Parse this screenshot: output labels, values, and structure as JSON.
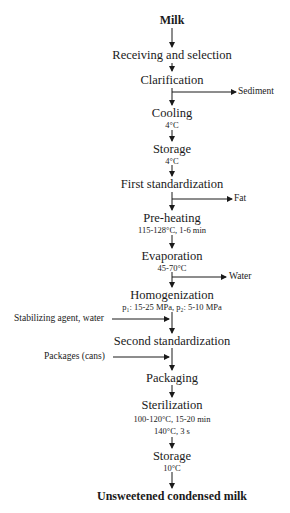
{
  "diagram": {
    "type": "process-flowchart",
    "start": "Milk",
    "end": "Unsweetened condensed milk",
    "steps": [
      {
        "label": "Receiving and selection",
        "detail": ""
      },
      {
        "label": "Clarification",
        "detail": ""
      },
      {
        "label": "Cooling",
        "detail": "4°C"
      },
      {
        "label": "Storage",
        "detail": "4°C"
      },
      {
        "label": "First standardization",
        "detail": ""
      },
      {
        "label": "Pre-heating",
        "detail": "115-128°C, 1-6 min"
      },
      {
        "label": "Evaporation",
        "detail": "45-70°C"
      },
      {
        "label": "Homogenization",
        "detail": "p₁: 15-25 MPa, p₂: 5-10 MPa"
      },
      {
        "label": "Second standardization",
        "detail": ""
      },
      {
        "label": "Packaging",
        "detail": ""
      },
      {
        "label": "Sterilization",
        "detail": "100-120°C, 15-20 min",
        "detail2": "140°C, 3 s"
      },
      {
        "label": "Storage",
        "detail": "10°C"
      }
    ],
    "outputs": [
      {
        "after": "Clarification",
        "label": "Sediment"
      },
      {
        "after": "First standardization",
        "label": "Fat"
      },
      {
        "after": "Evaporation",
        "label": "Water"
      }
    ],
    "inputs": [
      {
        "before": "Second standardization",
        "label": "Stabilizing agent, water"
      },
      {
        "before": "Packaging",
        "label": "Packages (cans)"
      }
    ],
    "colors": {
      "line": "#1a1a1a",
      "text": "#1a1a1a",
      "background": "#ffffff"
    }
  }
}
